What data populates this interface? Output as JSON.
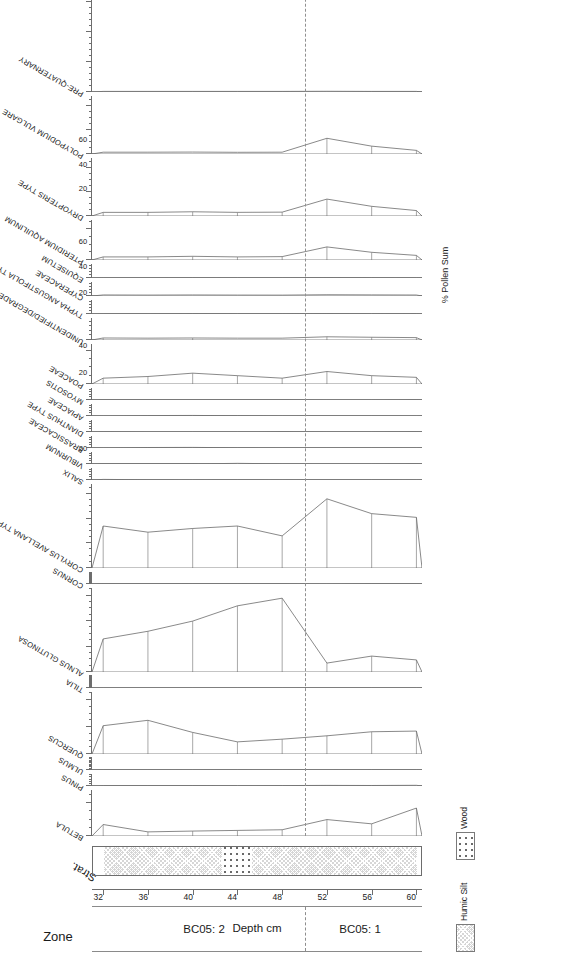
{
  "figure": {
    "title": "",
    "depth_axis_title": "Depth cm",
    "value_axis_title": "% Pollen Sum",
    "zone_column_title": "Zone"
  },
  "zones": [
    {
      "label": "BC05: 2",
      "from_depth": 32,
      "to_depth": 50
    },
    {
      "label": "BC05: 1",
      "from_depth": 50,
      "to_depth": 60
    }
  ],
  "zone_boundary_depth": 50,
  "depth_axis": {
    "label": "Depth cm",
    "ticks": [
      32,
      36,
      40,
      44,
      48,
      52,
      56,
      60
    ],
    "min": 31,
    "max": 60.5
  },
  "groups": [
    {
      "label": "TREES & SHRUBS"
    },
    {
      "label": "HERBS"
    },
    {
      "label": "MARSH"
    },
    {
      "label": "SPORES"
    },
    {
      "label": "MISC."
    },
    {
      "label": "TOTALS"
    }
  ],
  "stratigraphy": {
    "legend": [
      {
        "name": "Humic Silt",
        "pattern": "humic"
      },
      {
        "name": "Wood",
        "pattern": "wood"
      }
    ],
    "column_label": "Strat.",
    "segments": [
      {
        "type": "humic",
        "from_depth": 32,
        "to_depth": 42.5
      },
      {
        "type": "wood",
        "from_depth": 42.5,
        "to_depth": 45.2
      },
      {
        "type": "humic",
        "from_depth": 45.2,
        "to_depth": 60
      }
    ]
  },
  "chart_data": {
    "type": "area",
    "xlabel": "Depth cm",
    "ylabel": "% Pollen Sum",
    "x": [
      32,
      36,
      40,
      44,
      48,
      52,
      56,
      60
    ],
    "x_name": "depth_cm",
    "grid": false,
    "legend_position": "bottom-right",
    "taxa": [
      {
        "name": "BETULA",
        "group": "TREES & SHRUBS",
        "ticks": [
          0,
          20
        ],
        "max": 28,
        "width": 46,
        "values": [
          7.0,
          2.5,
          3.0,
          3.4,
          3.8,
          10.0,
          7.4,
          17.0
        ]
      },
      {
        "name": "PINUS",
        "group": "TREES & SHRUBS",
        "ticks": [
          0
        ],
        "max": 28,
        "width": 12,
        "values": [
          1.0,
          1.0,
          0.8,
          0.9,
          1.0,
          1.4,
          1.2,
          1.6
        ]
      },
      {
        "name": "ULMUS",
        "group": "TREES & SHRUBS",
        "ticks": [
          0
        ],
        "max": 45,
        "width": 12,
        "values": [
          1.1,
          1.0,
          0.9,
          1.0,
          0.8,
          0.9,
          1.1,
          1.0
        ]
      },
      {
        "name": "QUERCUS",
        "group": "TREES & SHRUBS",
        "ticks": [
          0,
          20,
          40
        ],
        "max": 46,
        "width": 62,
        "values": [
          21.0,
          25.0,
          16.0,
          9.0,
          11.0,
          13.5,
          16.5,
          17.0
        ]
      },
      {
        "name": "TILIA",
        "group": "TREES & SHRUBS",
        "ticks": [
          0
        ],
        "max": 66,
        "width": 12,
        "values": [
          0.7,
          0.8,
          0.7,
          0.9,
          0.8,
          1.1,
          1.0,
          0.9
        ]
      },
      {
        "name": "ALNUS GLUTINOSA",
        "group": "TREES & SHRUBS",
        "ticks": [
          0,
          20,
          40,
          60
        ],
        "max": 66,
        "width": 84,
        "values": [
          26.0,
          32.0,
          40.0,
          52.0,
          58.0,
          7.0,
          12.5,
          9.5
        ]
      },
      {
        "name": "CORNUS",
        "group": "TREES & SHRUBS",
        "ticks": [
          0
        ],
        "max": 68,
        "width": 12,
        "values": [
          0.6,
          0.5,
          0.6,
          0.6,
          0.5,
          0.8,
          0.7,
          0.6
        ]
      },
      {
        "name": "CORYLUS AVELLANA TYPE",
        "group": "TREES & SHRUBS",
        "ticks": [
          0,
          20,
          40,
          60
        ],
        "max": 68,
        "width": 84,
        "values": [
          34.0,
          29.0,
          32.0,
          34.0,
          26.0,
          56.0,
          44.0,
          41.0
        ]
      },
      {
        "name": "SALIX",
        "group": "HERBS",
        "ticks": [
          0
        ],
        "max": 24,
        "width": 12,
        "values": [
          1.2,
          0.5,
          0.4,
          0.5,
          0.4,
          0.5,
          0.5,
          0.4
        ]
      },
      {
        "name": "VIBURNUM",
        "group": "HERBS",
        "ticks": [
          0
        ],
        "max": 24,
        "width": 12,
        "values": [
          0.2,
          0.2,
          0.2,
          1.3,
          0.4,
          0.3,
          0.3,
          0.2
        ]
      },
      {
        "name": "BRASSICACEAE",
        "group": "HERBS",
        "ticks": [
          0
        ],
        "max": 24,
        "width": 12,
        "values": [
          0.3,
          1.0,
          1.2,
          0.5,
          0.3,
          0.3,
          0.4,
          0.3
        ]
      },
      {
        "name": "DIANTHUS TYPE",
        "group": "HERBS",
        "ticks": [
          0
        ],
        "max": 24,
        "width": 12,
        "values": [
          0.2,
          0.3,
          0.3,
          0.3,
          0.2,
          0.3,
          0.3,
          0.2
        ]
      },
      {
        "name": "APIACEAE",
        "group": "HERBS",
        "ticks": [
          0
        ],
        "max": 24,
        "width": 12,
        "values": [
          0.3,
          0.9,
          1.1,
          0.6,
          0.3,
          0.4,
          0.4,
          0.3
        ]
      },
      {
        "name": "MYOSOTIS",
        "group": "HERBS",
        "ticks": [
          0
        ],
        "max": 24,
        "width": 12,
        "values": [
          0.2,
          0.2,
          0.2,
          0.2,
          0.2,
          0.3,
          0.3,
          0.2
        ]
      },
      {
        "name": "POACEAE",
        "group": "HERBS",
        "ticks": [
          0,
          20
        ],
        "max": 24,
        "width": 40,
        "values": [
          3.5,
          4.5,
          6.5,
          5.0,
          3.5,
          7.5,
          5.0,
          4.0
        ]
      },
      {
        "name": "UNIDENTIFIED/DEGRADED",
        "group": "HERBS",
        "ticks": [
          0
        ],
        "max": 24,
        "width": 22,
        "values": [
          2.2,
          2.0,
          2.2,
          2.0,
          2.0,
          3.5,
          3.0,
          2.6
        ]
      },
      {
        "name": "TYPHA ANGUSTIFOLIA TYPE",
        "group": "MARSH",
        "ticks": [
          0
        ],
        "max": 24,
        "width": 14,
        "values": [
          0.5,
          0.5,
          0.6,
          0.5,
          0.5,
          0.8,
          0.7,
          0.6
        ]
      },
      {
        "name": "CYPERACEAE",
        "group": "MARSH",
        "ticks": [
          0
        ],
        "max": 24,
        "width": 14,
        "values": [
          1.8,
          1.6,
          1.8,
          1.6,
          1.5,
          2.2,
          1.9,
          1.7
        ]
      },
      {
        "name": "EQUISETUM",
        "group": "MARSH",
        "ticks": [
          0
        ],
        "max": 24,
        "width": 14,
        "values": [
          0.4,
          0.4,
          0.5,
          0.4,
          0.4,
          0.6,
          0.5,
          0.4
        ]
      },
      {
        "name": "PTERIDIUM AQUILINUM",
        "group": "SPORES",
        "ticks": [
          0,
          20
        ],
        "max": 26,
        "width": 40,
        "values": [
          2.0,
          2.0,
          2.4,
          2.0,
          2.2,
          8.5,
          5.0,
          3.0
        ]
      },
      {
        "name": "DRYOPTERIS TYPE",
        "group": "SPORES",
        "ticks": [
          0,
          20,
          40
        ],
        "max": 48,
        "width": 58,
        "values": [
          3.0,
          3.0,
          3.5,
          3.0,
          3.2,
          14.0,
          8.0,
          4.5
        ]
      },
      {
        "name": "POLYPODIUM VULGARE",
        "group": "SPORES",
        "ticks": [
          0,
          20,
          40
        ],
        "max": 48,
        "width": 58,
        "values": [
          1.5,
          1.5,
          1.6,
          1.4,
          1.5,
          13.0,
          6.5,
          3.0
        ]
      },
      {
        "name": "PRE-QUATERNARY",
        "group": "MISC.",
        "ticks": [
          0,
          50,
          100,
          150
        ],
        "max": 160,
        "width": 96,
        "values": [
          1.0,
          1.0,
          1.0,
          1.0,
          1.0,
          1.2,
          1.0,
          1.0
        ]
      },
      {
        "name": "TREES/SHRUBS/HERBS",
        "group": "MISC.",
        "ticks": [
          0,
          50,
          100,
          150
        ],
        "max": 160,
        "width": 96,
        "values": [
          100,
          100,
          100,
          100,
          100,
          100,
          100,
          100
        ],
        "stack": {
          "black": [
            74,
            72,
            63,
            67,
            72,
            79,
            54,
            62
          ],
          "hatch": [
            100,
            100,
            100,
            100,
            100,
            100,
            100,
            100
          ]
        }
      },
      {
        "name": "MARSH",
        "group": "TOTALS",
        "ticks": [
          0,
          20,
          40,
          60
        ],
        "max": 66,
        "width": 62,
        "values": [
          4.0,
          3.6,
          3.4,
          3.0,
          2.8,
          3.6,
          3.2,
          3.0
        ],
        "fill": "grey"
      },
      {
        "name": "SPORES",
        "group": "TOTALS",
        "ticks": [
          0,
          20,
          40,
          60
        ],
        "max": 66,
        "width": 62,
        "values": [
          6.5,
          6.5,
          7.5,
          6.4,
          6.9,
          36.0,
          20.0,
          11.0
        ],
        "fill": "grey"
      },
      {
        "name": "MISC.",
        "group": "TOTALS",
        "ticks": [
          0,
          20,
          40
        ],
        "max": 46,
        "width": 46,
        "values": [
          0.6,
          0.6,
          0.6,
          0.7,
          0.7,
          18.0,
          12.0,
          9.0
        ],
        "fill": "grey"
      }
    ]
  }
}
